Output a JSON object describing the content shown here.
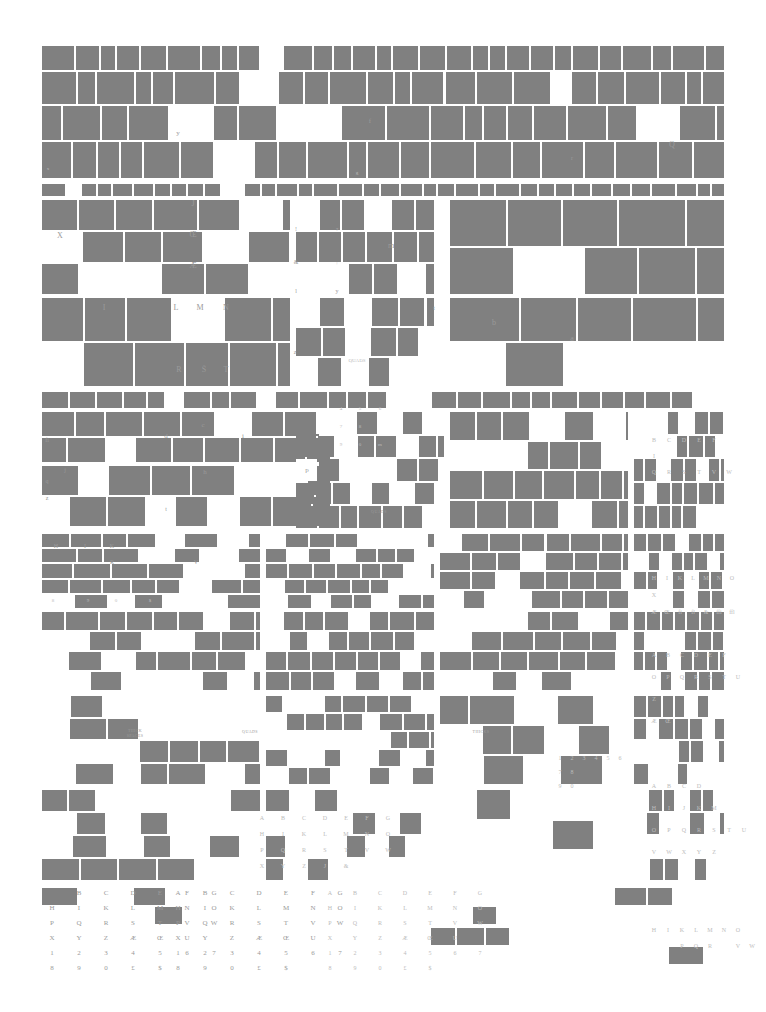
{
  "document": {
    "kind": "letterpress type case layout chart",
    "title": "Type Case Compartment Layout",
    "page_width": 766,
    "page_height": 1012,
    "colors": {
      "background": "#ffffff",
      "filled_compartment": "#808080",
      "empty_compartment": "#ffffff",
      "label_text": "#8e8e8e",
      "label_text_faint": "#bcbcbc"
    }
  },
  "labels": {
    "quads": "QUADS",
    "thicks": "THICKS",
    "thick_spaces_line1": "THICK",
    "thick_spaces_line2": "SPACES",
    "em_quads": "EM QUADS",
    "en_quads": "EN QUADS",
    "hair_spaces_line1": "THICK",
    "hair_spaces_line2": "SPACES"
  },
  "case_rows": [
    {
      "name": "upper-case-row-1",
      "y": 45,
      "height": 135,
      "empty_marks": [
        "y",
        "f",
        "j",
        "Q",
        "r",
        "g",
        "x"
      ]
    },
    {
      "name": "upper-case-row-2",
      "y": 182,
      "height": 205,
      "empty_marks": [
        "X",
        "J",
        "Œ",
        "Æ",
        "I",
        "L",
        "M",
        "N",
        "R",
        "S",
        "T",
        "!",
        "?",
        "m",
        "t",
        "b",
        "a",
        "z",
        "QUADS",
        "j",
        "i",
        "l",
        "k"
      ]
    },
    {
      "name": "lower-case-row-3",
      "y": 390,
      "height": 140,
      "empty_marks": [
        "fi",
        "d",
        "c",
        "i",
        "j",
        "q",
        "h",
        "p",
        "z",
        "v",
        "t",
        "4",
        "5",
        "6",
        "7",
        "8",
        "9",
        "0",
        "m",
        "n",
        "B",
        "C",
        "D",
        "E",
        "F",
        "I",
        "Q",
        "R",
        "S",
        "T",
        "V",
        "W",
        "QUADS"
      ]
    },
    {
      "name": "lower-case-row-4",
      "y": 533,
      "height": 160,
      "empty_marks": [
        "H",
        "I",
        "K",
        "R",
        "V",
        "8",
        "9",
        "0",
        "$",
        "A",
        "T",
        "Q",
        "S",
        "M",
        "E",
        "T",
        "V",
        "œ",
        "P",
        "U",
        "H",
        "I",
        "K",
        "L",
        "M",
        "N",
        "O",
        "X",
        "QUADS",
        "A",
        "B",
        "C",
        "D",
        "E",
        "F",
        "ffi",
        "ffl",
        "fi",
        "fl",
        "d",
        "e",
        "i",
        "s",
        "7",
        "8",
        "9",
        "0",
        "ÆŒ",
        "&"
      ]
    },
    {
      "name": "lower-case-row-5",
      "y": 695,
      "height": 190,
      "empty_marks": [
        "THICK SPACES",
        "QUADS",
        "THICKS",
        "l",
        "m",
        "n",
        "h",
        "o",
        "r",
        "p",
        "w",
        "v",
        "u",
        "k",
        "i",
        "a",
        "t",
        "j",
        "O",
        "P",
        "Q",
        "R",
        "S",
        "T",
        "U",
        "Z",
        "Æ",
        "Œ",
        "A",
        "B",
        "C",
        "D",
        "H",
        "I",
        "J",
        "K",
        "M",
        "1",
        "2",
        "3",
        "4",
        "5",
        "6",
        "7",
        "8",
        "9",
        "0",
        "b",
        "c",
        "d",
        "e",
        "f",
        "g",
        "y",
        "p",
        "s"
      ]
    },
    {
      "name": "lower-case-row-6",
      "y": 888,
      "height": 80,
      "empty_marks": []
    }
  ],
  "glyph_grids": [
    {
      "name": "bottom-left-upper-alphabet",
      "x": 52,
      "y": 893,
      "col_gap": 27,
      "row_gap": 15,
      "font_size": 7,
      "rows": [
        [
          "",
          "B",
          "C",
          "D",
          "E",
          "F",
          "G"
        ],
        [
          "H",
          "I",
          "K",
          "L",
          "M",
          "N",
          "O"
        ],
        [
          "P",
          "Q",
          "R",
          "S",
          "T",
          "V",
          "W"
        ],
        [
          "X",
          "Y",
          "Z",
          "Æ",
          "Œ",
          "U",
          ""
        ],
        [
          "1",
          "2",
          "3",
          "4",
          "5",
          "6",
          "7"
        ],
        [
          "8",
          "9",
          "0",
          "£",
          "$",
          "",
          ""
        ]
      ]
    },
    {
      "name": "bottom-mid-upper-alphabet",
      "x": 178,
      "y": 893,
      "col_gap": 27,
      "row_gap": 15,
      "font_size": 7,
      "rows": [
        [
          "A",
          "B",
          "C",
          "D",
          "E",
          "F",
          "G"
        ],
        [
          "H",
          "I",
          "K",
          "L",
          "M",
          "N",
          "O"
        ],
        [
          "P",
          "Q",
          "R",
          "S",
          "T",
          "V",
          "W"
        ],
        [
          "X",
          "Y",
          "Z",
          "Æ",
          "Œ",
          "U",
          ""
        ],
        [
          "1",
          "2",
          "3",
          "4",
          "5",
          "6",
          "7"
        ],
        [
          "8",
          "9",
          "0",
          "£",
          "$",
          "",
          ""
        ]
      ]
    },
    {
      "name": "bottom-right-upper-alphabet",
      "x": 330,
      "y": 893,
      "col_gap": 25,
      "row_gap": 15,
      "font_size": 6,
      "rows": [
        [
          "A",
          "B",
          "C",
          "D",
          "E",
          "F",
          "G"
        ],
        [
          "H",
          "I",
          "K",
          "L",
          "M",
          "N",
          "O"
        ],
        [
          "P",
          "Q",
          "R",
          "S",
          "T",
          "V",
          "W"
        ],
        [
          "X",
          "Y",
          "Z",
          "Æ",
          "Œ",
          "U",
          ""
        ],
        [
          "1",
          "2",
          "3",
          "4",
          "5",
          "6",
          "7"
        ],
        [
          "8",
          "9",
          "0",
          "£",
          "$",
          "",
          ""
        ]
      ]
    },
    {
      "name": "right-column-alphabet-a",
      "x": 654,
      "y": 440,
      "col_gap": 15,
      "row_gap": 16,
      "font_size": 6,
      "rows": [
        [
          "B",
          "C",
          "D",
          "E",
          "F"
        ],
        [
          "I",
          "",
          "",
          "",
          ""
        ],
        [
          "Q",
          "R",
          "S",
          "T",
          "V",
          "W"
        ]
      ]
    },
    {
      "name": "right-column-alphabet-b",
      "x": 654,
      "y": 578,
      "col_gap": 13,
      "row_gap": 17,
      "font_size": 6,
      "rows": [
        [
          "H",
          "I",
          "K",
          "L",
          "M",
          "N",
          "O"
        ],
        [
          "X",
          "",
          "",
          "",
          "",
          "",
          ""
        ],
        [
          "Æ",
          "Œ",
          "fi",
          "fl",
          "&",
          "ffi",
          "ffl"
        ]
      ]
    },
    {
      "name": "right-column-alphabet-c",
      "x": 654,
      "y": 655,
      "col_gap": 14,
      "row_gap": 22,
      "font_size": 6,
      "rows": [
        [
          "A",
          "B",
          "C",
          "D",
          "E",
          "F"
        ],
        [
          "O",
          "P",
          "Q",
          "R",
          "S",
          "T",
          "U"
        ],
        [
          "Z",
          "",
          "",
          "",
          "",
          ""
        ],
        [
          "Æ",
          "Œ",
          "",
          "",
          "",
          ""
        ]
      ]
    },
    {
      "name": "right-column-alphabet-d",
      "x": 654,
      "y": 786,
      "col_gap": 15,
      "row_gap": 22,
      "font_size": 6,
      "rows": [
        [
          "A",
          "B",
          "C",
          "D"
        ],
        [
          "H",
          "I",
          "J",
          "K",
          "M"
        ],
        [
          "O",
          "P",
          "Q",
          "R",
          "S",
          "T",
          "U"
        ],
        [
          "V",
          "W",
          "X",
          "Y",
          "Z"
        ]
      ]
    },
    {
      "name": "right-bottom-alphabet",
      "x": 654,
      "y": 930,
      "col_gap": 14,
      "row_gap": 16,
      "font_size": 6,
      "rows": [
        [
          "H",
          "I",
          "K",
          "L",
          "M",
          "N",
          "O"
        ],
        [
          "",
          "",
          "P",
          "Q",
          "R",
          "",
          "V",
          "W"
        ]
      ]
    },
    {
      "name": "mid-lower-alphabet-a",
      "x": 262,
      "y": 818,
      "col_gap": 21,
      "row_gap": 16,
      "font_size": 6,
      "rows": [
        [
          "A",
          "B",
          "C",
          "D",
          "E",
          "F",
          "G"
        ],
        [
          "H",
          "I",
          "K",
          "L",
          "M",
          "N",
          "O"
        ],
        [
          "P",
          "Q",
          "R",
          "S",
          "T",
          "V",
          "W"
        ],
        [
          "X",
          "Y",
          "Z",
          "J",
          "&",
          "",
          ""
        ]
      ]
    },
    {
      "name": "numerals-mid-right",
      "x": 560,
      "y": 758,
      "col_gap": 12,
      "row_gap": 14,
      "font_size": 6,
      "rows": [
        [
          "1",
          "2",
          "3",
          "4",
          "5",
          "6"
        ],
        [
          "7",
          "8",
          "",
          "",
          "",
          ""
        ],
        [
          "9",
          "0",
          "",
          "",
          "",
          ""
        ]
      ]
    }
  ],
  "scattered_marks": [
    {
      "t": "y",
      "x": 178,
      "y": 133,
      "size": 7
    },
    {
      "t": "f",
      "x": 370,
      "y": 121,
      "size": 7
    },
    {
      "t": "Q",
      "x": 672,
      "y": 144,
      "size": 8
    },
    {
      "t": "r",
      "x": 572,
      "y": 158,
      "size": 6
    },
    {
      "t": "g",
      "x": 357,
      "y": 172,
      "size": 5
    },
    {
      "t": "x",
      "x": 48,
      "y": 168,
      "size": 5
    },
    {
      "t": "X",
      "x": 60,
      "y": 235,
      "size": 8
    },
    {
      "t": "J",
      "x": 193,
      "y": 203,
      "size": 8
    },
    {
      "t": "Œ",
      "x": 193,
      "y": 234,
      "size": 8
    },
    {
      "t": "Æ",
      "x": 193,
      "y": 265,
      "size": 8
    },
    {
      "t": "I",
      "x": 104,
      "y": 307,
      "size": 8
    },
    {
      "t": "L",
      "x": 176,
      "y": 307,
      "size": 8
    },
    {
      "t": "M",
      "x": 200,
      "y": 307,
      "size": 8
    },
    {
      "t": "N",
      "x": 226,
      "y": 307,
      "size": 8
    },
    {
      "t": "R",
      "x": 179,
      "y": 369,
      "size": 8
    },
    {
      "t": "Š",
      "x": 204,
      "y": 369,
      "size": 8
    },
    {
      "t": "T",
      "x": 226,
      "y": 369,
      "size": 8
    },
    {
      "t": "!",
      "x": 296,
      "y": 229,
      "size": 6
    },
    {
      "t": "?",
      "x": 337,
      "y": 229,
      "size": 5
    },
    {
      "t": "&",
      "x": 296,
      "y": 262,
      "size": 6
    },
    {
      "t": ";",
      "x": 337,
      "y": 262,
      "size": 5
    },
    {
      "t": "l",
      "x": 296,
      "y": 291,
      "size": 6
    },
    {
      "t": "y",
      "x": 337,
      "y": 291,
      "size": 6
    },
    {
      "t": "m",
      "x": 391,
      "y": 245,
      "size": 8
    },
    {
      "t": "t",
      "x": 434,
      "y": 308,
      "size": 7
    },
    {
      "t": "b",
      "x": 494,
      "y": 322,
      "size": 8
    },
    {
      "t": "a",
      "x": 572,
      "y": 338,
      "size": 8
    },
    {
      "t": "z",
      "x": 295,
      "y": 352,
      "size": 6
    },
    {
      "t": "QUADS",
      "x": 357,
      "y": 360,
      "size": 5
    },
    {
      "t": "fi",
      "x": 47,
      "y": 440,
      "size": 6
    },
    {
      "t": "d",
      "x": 166,
      "y": 436,
      "size": 7
    },
    {
      "t": "c",
      "x": 203,
      "y": 425,
      "size": 7
    },
    {
      "t": "i",
      "x": 243,
      "y": 436,
      "size": 7
    },
    {
      "t": "q",
      "x": 47,
      "y": 481,
      "size": 6
    },
    {
      "t": "z",
      "x": 47,
      "y": 498,
      "size": 6
    },
    {
      "t": "j",
      "x": 65,
      "y": 470,
      "size": 6
    },
    {
      "t": "h",
      "x": 205,
      "y": 472,
      "size": 7
    },
    {
      "t": "p",
      "x": 307,
      "y": 470,
      "size": 7
    },
    {
      "t": "t",
      "x": 166,
      "y": 509,
      "size": 6
    },
    {
      "t": "QUADS",
      "x": 379,
      "y": 511,
      "size": 4
    },
    {
      "t": "4",
      "x": 341,
      "y": 408,
      "size": 5
    },
    {
      "t": "5",
      "x": 360,
      "y": 408,
      "size": 5
    },
    {
      "t": "6",
      "x": 380,
      "y": 408,
      "size": 5
    },
    {
      "t": "7",
      "x": 341,
      "y": 426,
      "size": 5
    },
    {
      "t": "8",
      "x": 360,
      "y": 426,
      "size": 5
    },
    {
      "t": "9",
      "x": 341,
      "y": 444,
      "size": 5
    },
    {
      "t": "0",
      "x": 360,
      "y": 444,
      "size": 5
    },
    {
      "t": "m",
      "x": 380,
      "y": 444,
      "size": 5
    },
    {
      "t": "H",
      "x": 56,
      "y": 546,
      "size": 6
    },
    {
      "t": "I",
      "x": 85,
      "y": 546,
      "size": 6
    },
    {
      "t": "K",
      "x": 112,
      "y": 546,
      "size": 6
    },
    {
      "t": "R",
      "x": 112,
      "y": 562,
      "size": 6
    },
    {
      "t": "V",
      "x": 196,
      "y": 562,
      "size": 6
    },
    {
      "t": "8",
      "x": 53,
      "y": 600,
      "size": 5
    },
    {
      "t": "9",
      "x": 88,
      "y": 600,
      "size": 5
    },
    {
      "t": "0",
      "x": 116,
      "y": 600,
      "size": 5
    },
    {
      "t": "$",
      "x": 150,
      "y": 600,
      "size": 5
    },
    {
      "t": "THICK",
      "x": 135,
      "y": 730,
      "size": 4
    },
    {
      "t": "SPACES",
      "x": 135,
      "y": 735,
      "size": 4
    },
    {
      "t": "QUADS",
      "x": 250,
      "y": 731,
      "size": 4
    },
    {
      "t": "THICKS",
      "x": 481,
      "y": 731,
      "size": 4
    }
  ]
}
